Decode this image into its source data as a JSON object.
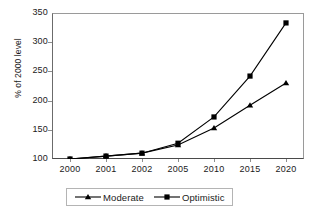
{
  "chart_data": {
    "type": "line",
    "title": "",
    "xlabel": "",
    "ylabel": "% of 2000 level",
    "categories": [
      "2000",
      "2001",
      "2002",
      "2005",
      "2010",
      "2015",
      "2020"
    ],
    "ylim": [
      100,
      350
    ],
    "yticks": [
      100,
      150,
      200,
      250,
      300,
      350
    ],
    "ytick_labels": [
      "100",
      "150",
      "200",
      "250",
      "300",
      "350"
    ],
    "grid": false,
    "legend_position": "bottom",
    "series": [
      {
        "name": "Moderate",
        "marker": "triangle",
        "color": "#000000",
        "values": [
          100,
          105,
          110,
          124,
          153,
          192,
          230
        ]
      },
      {
        "name": "Optimistic",
        "marker": "square",
        "color": "#000000",
        "values": [
          100,
          105,
          110,
          127,
          172,
          242,
          333
        ]
      }
    ]
  },
  "axes": {
    "y_title": "% of 2000 level"
  },
  "legend": {
    "entries": [
      {
        "label": "Moderate",
        "marker": "triangle-marker"
      },
      {
        "label": "Optimistic",
        "marker": "square-marker"
      }
    ]
  }
}
